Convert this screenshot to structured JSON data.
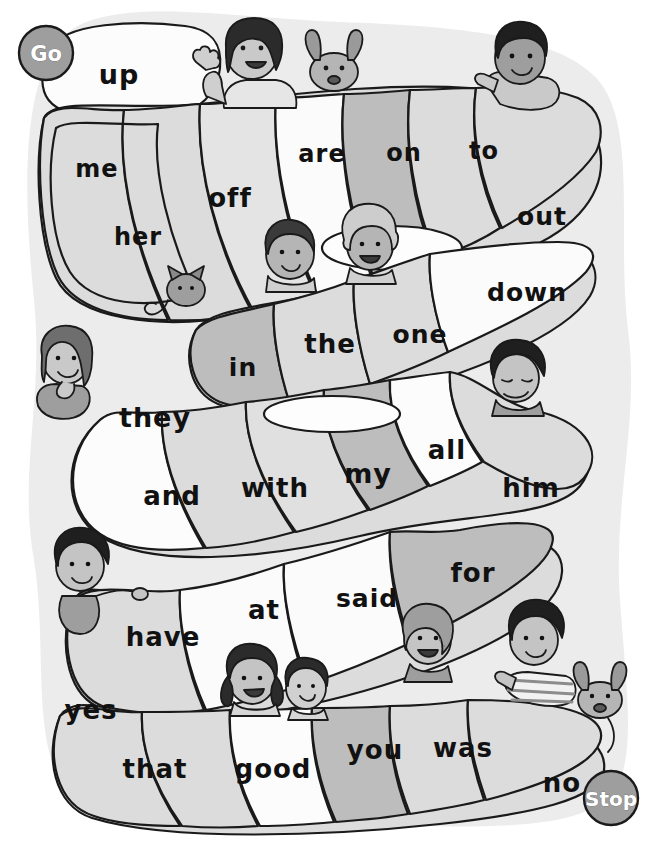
{
  "page": {
    "width": 652,
    "height": 841,
    "background_color": "#ffffff"
  },
  "colors": {
    "outline": "#1a1a1a",
    "backdrop": "#ececec",
    "segment_light": "#fcfcfc",
    "segment_mid": "#dcdcdc",
    "segment_dark": "#bdbdbd",
    "marker_fill": "#9e9e9e",
    "marker_text": "#ffffff",
    "word_text": "#111111",
    "skin": "#bdbdbd",
    "hair_dark": "#2b2b2b",
    "hair_mid": "#6e6e6e",
    "shirt": "#d6d6d6"
  },
  "markers": {
    "start": {
      "label": "Go",
      "x": 46,
      "y": 53,
      "r": 27
    },
    "end": {
      "label": "Stop",
      "x": 611,
      "y": 798,
      "r": 27
    }
  },
  "rows": [
    {
      "name": "row-1",
      "words": [
        {
          "label": "up",
          "x": 119,
          "y": 76,
          "shade": "light",
          "size": 27
        }
      ]
    },
    {
      "name": "row-2",
      "words": [
        {
          "label": "me",
          "x": 97,
          "y": 170,
          "shade": "mid",
          "size": 24
        },
        {
          "label": "her",
          "x": 138,
          "y": 238,
          "shade": "mid",
          "size": 24
        },
        {
          "label": "off",
          "x": 230,
          "y": 199,
          "shade": "mid",
          "size": 26
        },
        {
          "label": "are",
          "x": 322,
          "y": 155,
          "shade": "light",
          "size": 24
        },
        {
          "label": "on",
          "x": 404,
          "y": 154,
          "shade": "dark",
          "size": 24
        },
        {
          "label": "to",
          "x": 484,
          "y": 152,
          "shade": "mid",
          "size": 24
        },
        {
          "label": "out",
          "x": 542,
          "y": 218,
          "shade": "mid",
          "size": 25
        }
      ]
    },
    {
      "name": "row-3",
      "words": [
        {
          "label": "in",
          "x": 243,
          "y": 369,
          "shade": "dark",
          "size": 25
        },
        {
          "label": "the",
          "x": 330,
          "y": 345,
          "shade": "mid",
          "size": 26
        },
        {
          "label": "one",
          "x": 420,
          "y": 336,
          "shade": "mid",
          "size": 25
        },
        {
          "label": "down",
          "x": 527,
          "y": 294,
          "shade": "light",
          "size": 25
        }
      ]
    },
    {
      "name": "row-4",
      "words": [
        {
          "label": "they",
          "x": 155,
          "y": 419,
          "shade": "light",
          "size": 27
        },
        {
          "label": "and",
          "x": 172,
          "y": 497,
          "shade": "mid",
          "size": 26
        },
        {
          "label": "with",
          "x": 275,
          "y": 489,
          "shade": "mid",
          "size": 26
        },
        {
          "label": "my",
          "x": 368,
          "y": 475,
          "shade": "dark",
          "size": 27
        },
        {
          "label": "all",
          "x": 447,
          "y": 451,
          "shade": "light",
          "size": 26
        },
        {
          "label": "him",
          "x": 531,
          "y": 489,
          "shade": "mid",
          "size": 26
        }
      ]
    },
    {
      "name": "row-5",
      "words": [
        {
          "label": "have",
          "x": 163,
          "y": 638,
          "shade": "mid",
          "size": 26
        },
        {
          "label": "at",
          "x": 264,
          "y": 611,
          "shade": "light",
          "size": 26
        },
        {
          "label": "said",
          "x": 367,
          "y": 600,
          "shade": "light",
          "size": 25
        },
        {
          "label": "for",
          "x": 473,
          "y": 574,
          "shade": "dark",
          "size": 26
        }
      ]
    },
    {
      "name": "row-6",
      "words": [
        {
          "label": "yes",
          "x": 91,
          "y": 711,
          "shade": "mid",
          "size": 26
        },
        {
          "label": "that",
          "x": 155,
          "y": 770,
          "shade": "mid",
          "size": 26
        },
        {
          "label": "good",
          "x": 273,
          "y": 770,
          "shade": "light",
          "size": 26
        },
        {
          "label": "you",
          "x": 375,
          "y": 751,
          "shade": "dark",
          "size": 26
        },
        {
          "label": "was",
          "x": 463,
          "y": 749,
          "shade": "mid",
          "size": 26
        },
        {
          "label": "no",
          "x": 562,
          "y": 784,
          "shade": "mid",
          "size": 26
        }
      ]
    }
  ],
  "characters": [
    {
      "name": "girl-waving-dark-bob-hair",
      "x": 250,
      "y": 70
    },
    {
      "name": "dog-brown-floppy-ears-top",
      "x": 330,
      "y": 72
    },
    {
      "name": "boy-pointing-dark-curly-hair",
      "x": 520,
      "y": 70
    },
    {
      "name": "boy-dark-hair-mid-left",
      "x": 288,
      "y": 258
    },
    {
      "name": "girl-curly-blonde-hair",
      "x": 370,
      "y": 248
    },
    {
      "name": "cat-grey-striped",
      "x": 182,
      "y": 295
    },
    {
      "name": "girl-long-hair-hand-on-chin",
      "x": 62,
      "y": 380
    },
    {
      "name": "boy-dark-hair-resting-chin",
      "x": 513,
      "y": 381
    },
    {
      "name": "boy-dark-hair-holding-rope",
      "x": 82,
      "y": 570
    },
    {
      "name": "girl-dark-pigtails",
      "x": 250,
      "y": 678
    },
    {
      "name": "girl-short-dark-hair",
      "x": 305,
      "y": 685
    },
    {
      "name": "boy-freckles-curly-hair",
      "x": 427,
      "y": 640
    },
    {
      "name": "boy-striped-shirt-pointing",
      "x": 532,
      "y": 640
    },
    {
      "name": "dog-grey-floppy-ears-bottom",
      "x": 600,
      "y": 700
    }
  ]
}
